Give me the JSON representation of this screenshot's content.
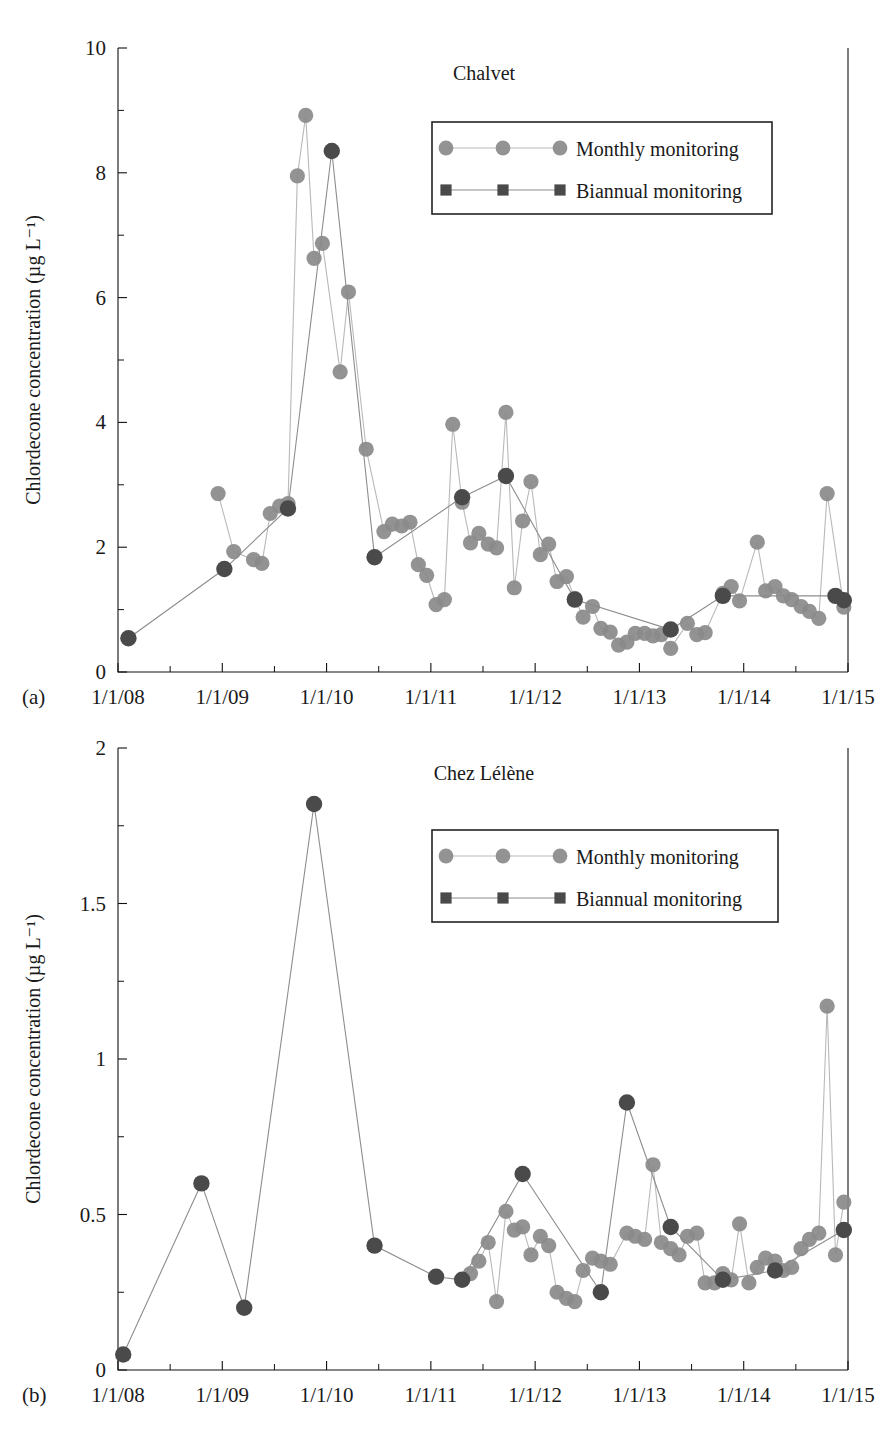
{
  "figure": {
    "background": "#ffffff",
    "marker_colors": {
      "monthly": "#8a8a8a",
      "biannual": "#4a4a4a",
      "monthly_line": "#b9b9b9",
      "biannual_line": "#8d8d8d"
    }
  },
  "chart_data": [
    {
      "id": "chalvet",
      "panel_label": "(a)",
      "type": "line",
      "title": "Chalvet",
      "xlabel": "",
      "ylabel": "Chlordecone concentration (µg L⁻¹)",
      "ylim": [
        0,
        10
      ],
      "yticks": [
        0,
        2,
        4,
        6,
        8,
        10
      ],
      "ytick_labels": [
        "0",
        "2",
        "4",
        "6",
        "8",
        "10"
      ],
      "yminorticks": [
        1,
        3,
        5,
        7,
        9
      ],
      "xlim": [
        "1/1/08",
        "1/1/15"
      ],
      "xticks": [
        2008.0,
        2009.0,
        2010.0,
        2011.0,
        2012.0,
        2013.0,
        2014.0,
        2015.0
      ],
      "xtick_labels": [
        "1/1/08",
        "1/1/09",
        "1/1/10",
        "1/1/11",
        "1/1/12",
        "1/1/13",
        "1/1/14",
        "1/1/15"
      ],
      "xminorticks": [
        2008.5,
        2009.5,
        2010.5,
        2011.5,
        2012.5,
        2013.5,
        2014.5
      ],
      "grid": false,
      "legend_position": "upper-right",
      "series": [
        {
          "name": "Monthly monitoring",
          "marker": "circle",
          "color": "#8a8a8a",
          "points": [
            [
              2008.96,
              2.86
            ],
            [
              2009.11,
              1.93
            ],
            [
              2009.3,
              1.8
            ],
            [
              2009.38,
              1.74
            ],
            [
              2009.46,
              2.54
            ],
            [
              2009.55,
              2.66
            ],
            [
              2009.63,
              2.7
            ],
            [
              2009.72,
              7.95
            ],
            [
              2009.8,
              8.92
            ],
            [
              2009.88,
              6.63
            ],
            [
              2009.96,
              6.87
            ],
            [
              2010.13,
              4.81
            ],
            [
              2010.21,
              6.09
            ],
            [
              2010.38,
              3.57
            ],
            [
              2010.55,
              2.25
            ],
            [
              2010.63,
              2.37
            ],
            [
              2010.72,
              2.34
            ],
            [
              2010.8,
              2.4
            ],
            [
              2010.88,
              1.72
            ],
            [
              2010.96,
              1.55
            ],
            [
              2011.05,
              1.08
            ],
            [
              2011.13,
              1.16
            ],
            [
              2011.21,
              3.97
            ],
            [
              2011.3,
              2.72
            ],
            [
              2011.38,
              2.07
            ],
            [
              2011.46,
              2.22
            ],
            [
              2011.55,
              2.05
            ],
            [
              2011.63,
              1.99
            ],
            [
              2011.72,
              4.16
            ],
            [
              2011.8,
              1.35
            ],
            [
              2011.88,
              2.42
            ],
            [
              2011.96,
              3.05
            ],
            [
              2012.05,
              1.88
            ],
            [
              2012.13,
              2.05
            ],
            [
              2012.21,
              1.45
            ],
            [
              2012.3,
              1.53
            ],
            [
              2012.38,
              1.18
            ],
            [
              2012.46,
              0.88
            ],
            [
              2012.55,
              1.05
            ],
            [
              2012.63,
              0.7
            ],
            [
              2012.72,
              0.64
            ],
            [
              2012.8,
              0.43
            ],
            [
              2012.88,
              0.48
            ],
            [
              2012.96,
              0.62
            ],
            [
              2013.05,
              0.62
            ],
            [
              2013.13,
              0.58
            ],
            [
              2013.21,
              0.6
            ],
            [
              2013.3,
              0.38
            ],
            [
              2013.46,
              0.78
            ],
            [
              2013.55,
              0.6
            ],
            [
              2013.63,
              0.63
            ],
            [
              2013.8,
              1.26
            ],
            [
              2013.88,
              1.37
            ],
            [
              2013.96,
              1.14
            ],
            [
              2014.13,
              2.08
            ],
            [
              2014.21,
              1.3
            ],
            [
              2014.3,
              1.37
            ],
            [
              2014.38,
              1.22
            ],
            [
              2014.46,
              1.16
            ],
            [
              2014.55,
              1.05
            ],
            [
              2014.63,
              0.97
            ],
            [
              2014.72,
              0.86
            ],
            [
              2014.8,
              2.86
            ],
            [
              2014.96,
              1.04
            ]
          ]
        },
        {
          "name": "Biannual monitoring",
          "marker": "square",
          "color": "#4a4a4a",
          "points": [
            [
              2008.1,
              0.54
            ],
            [
              2009.02,
              1.65
            ],
            [
              2009.63,
              2.62
            ],
            [
              2010.05,
              8.35
            ],
            [
              2010.46,
              1.84
            ],
            [
              2011.3,
              2.8
            ],
            [
              2011.72,
              3.14
            ],
            [
              2012.38,
              1.16
            ],
            [
              2013.3,
              0.68
            ],
            [
              2013.8,
              1.22
            ],
            [
              2014.88,
              1.22
            ],
            [
              2014.96,
              1.15
            ]
          ]
        }
      ]
    },
    {
      "id": "chez-lelene",
      "panel_label": "(b)",
      "type": "line",
      "title": "Chez Lélène",
      "xlabel": "",
      "ylabel": "Chlordecone concentration (µg L⁻¹)",
      "ylim": [
        0,
        2
      ],
      "yticks": [
        0,
        0.5,
        1,
        1.5,
        2
      ],
      "ytick_labels": [
        "0",
        "0.5",
        "1",
        "1.5",
        "2"
      ],
      "yminorticks": [
        0.25,
        0.75,
        1.25,
        1.75
      ],
      "xlim": [
        "1/1/08",
        "1/1/15"
      ],
      "xticks": [
        2008.0,
        2009.0,
        2010.0,
        2011.0,
        2012.0,
        2013.0,
        2014.0,
        2015.0
      ],
      "xtick_labels": [
        "1/1/08",
        "1/1/09",
        "1/1/10",
        "1/1/11",
        "1/1/12",
        "1/1/13",
        "1/1/14",
        "1/1/15"
      ],
      "xminorticks": [
        2008.5,
        2009.5,
        2010.5,
        2011.5,
        2012.5,
        2013.5,
        2014.5
      ],
      "grid": false,
      "legend_position": "upper-right",
      "series": [
        {
          "name": "Monthly monitoring",
          "marker": "circle",
          "color": "#8a8a8a",
          "points": [
            [
              2011.38,
              0.31
            ],
            [
              2011.46,
              0.35
            ],
            [
              2011.55,
              0.41
            ],
            [
              2011.63,
              0.22
            ],
            [
              2011.72,
              0.51
            ],
            [
              2011.8,
              0.45
            ],
            [
              2011.88,
              0.46
            ],
            [
              2011.96,
              0.37
            ],
            [
              2012.05,
              0.43
            ],
            [
              2012.13,
              0.4
            ],
            [
              2012.21,
              0.25
            ],
            [
              2012.3,
              0.23
            ],
            [
              2012.38,
              0.22
            ],
            [
              2012.46,
              0.32
            ],
            [
              2012.55,
              0.36
            ],
            [
              2012.63,
              0.35
            ],
            [
              2012.72,
              0.34
            ],
            [
              2012.88,
              0.44
            ],
            [
              2012.96,
              0.43
            ],
            [
              2013.05,
              0.42
            ],
            [
              2013.13,
              0.66
            ],
            [
              2013.21,
              0.41
            ],
            [
              2013.3,
              0.39
            ],
            [
              2013.38,
              0.37
            ],
            [
              2013.46,
              0.43
            ],
            [
              2013.55,
              0.44
            ],
            [
              2013.63,
              0.28
            ],
            [
              2013.72,
              0.28
            ],
            [
              2013.8,
              0.31
            ],
            [
              2013.88,
              0.29
            ],
            [
              2013.96,
              0.47
            ],
            [
              2014.05,
              0.28
            ],
            [
              2014.13,
              0.33
            ],
            [
              2014.21,
              0.36
            ],
            [
              2014.3,
              0.35
            ],
            [
              2014.38,
              0.32
            ],
            [
              2014.46,
              0.33
            ],
            [
              2014.55,
              0.39
            ],
            [
              2014.63,
              0.42
            ],
            [
              2014.72,
              0.44
            ],
            [
              2014.8,
              1.17
            ],
            [
              2014.88,
              0.37
            ],
            [
              2014.96,
              0.54
            ]
          ]
        },
        {
          "name": "Biannual monitoring",
          "marker": "square",
          "color": "#4a4a4a",
          "points": [
            [
              2008.05,
              0.05
            ],
            [
              2008.8,
              0.6
            ],
            [
              2009.21,
              0.2
            ],
            [
              2009.88,
              1.82
            ],
            [
              2010.46,
              0.4
            ],
            [
              2011.05,
              0.3
            ],
            [
              2011.3,
              0.29
            ],
            [
              2011.88,
              0.63
            ],
            [
              2012.63,
              0.25
            ],
            [
              2012.88,
              0.86
            ],
            [
              2013.3,
              0.46
            ],
            [
              2013.8,
              0.29
            ],
            [
              2014.3,
              0.32
            ],
            [
              2014.96,
              0.45
            ]
          ]
        }
      ]
    }
  ],
  "legend": {
    "entries": [
      {
        "label": "Monthly monitoring",
        "marker": "circle",
        "color": "#8a8a8a"
      },
      {
        "label": "Biannual monitoring",
        "marker": "square",
        "color": "#4a4a4a"
      }
    ]
  }
}
